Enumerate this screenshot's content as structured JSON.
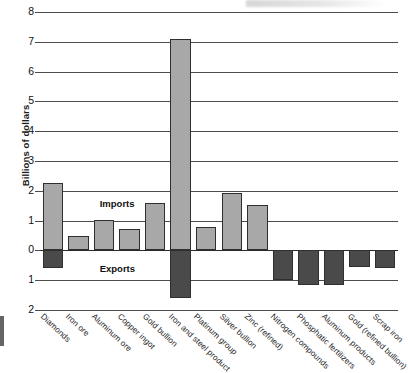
{
  "chart_data": {
    "type": "bar",
    "title": "",
    "xlabel": "",
    "ylabel": "Billions of dollars",
    "ylim": [
      -2,
      8
    ],
    "grid": true,
    "legend_position": "inside-plot",
    "ytick_labels": [
      "8",
      "7",
      "6",
      "5",
      "4",
      "3",
      "2",
      "1",
      "0",
      "1",
      "2"
    ],
    "ytick_values": [
      8,
      7,
      6,
      5,
      4,
      3,
      2,
      1,
      0,
      -1,
      -2
    ],
    "annotations": [
      "Imports",
      "Exports"
    ],
    "categories": [
      "Diamonds",
      "Iron ore",
      "Aluminum ore",
      "Copper ingot",
      "Gold bullion",
      "Iron and steel product",
      "Platinum group",
      "Silver bullion",
      "Zinc (refined)",
      "Nitrogen compounds",
      "Phosphatic fertilizers",
      "Aluminum products",
      "Gold (refined bullion)",
      "Scrap iron"
    ],
    "series": [
      {
        "name": "Imports",
        "color": "#a8a8a8",
        "values": [
          2.27,
          0.47,
          1.02,
          0.73,
          1.6,
          7.1,
          0.8,
          1.93,
          1.53,
          0,
          0,
          0,
          0,
          0
        ]
      },
      {
        "name": "Exports",
        "color": "#4a4a4a",
        "values": [
          -0.6,
          0,
          0,
          0,
          0,
          -1.6,
          0,
          0,
          0,
          -1.0,
          -1.15,
          -1.15,
          -0.55,
          -0.6
        ]
      }
    ]
  }
}
